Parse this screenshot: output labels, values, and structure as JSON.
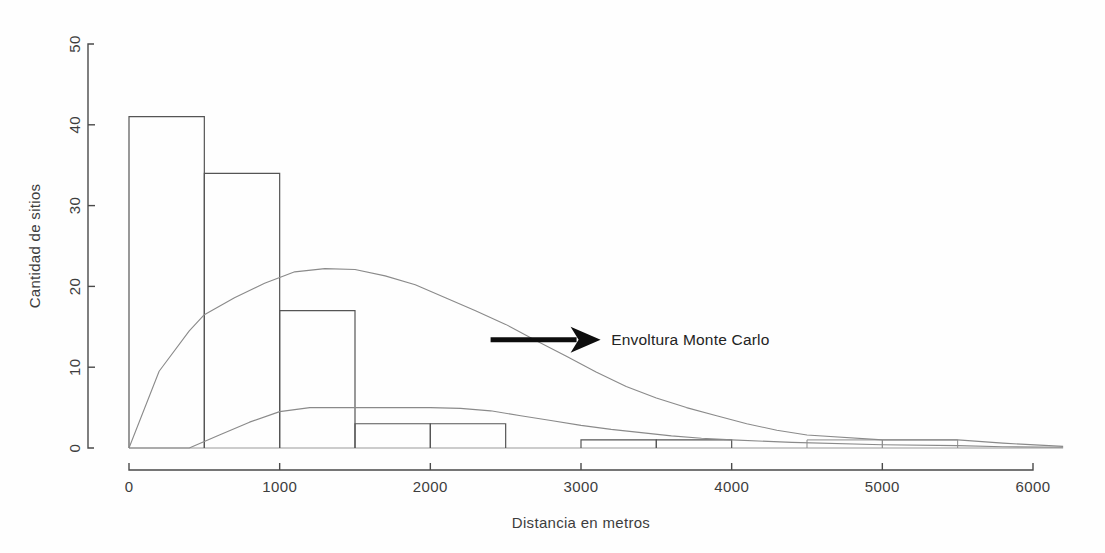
{
  "chart_data": {
    "type": "bar",
    "title": "",
    "subtitle": "",
    "xlabel": "Distancia en metros",
    "ylabel": "Cantidad de sitios",
    "xlim": [
      0,
      6200
    ],
    "ylim": [
      0,
      50
    ],
    "grid": false,
    "legend_position": "none",
    "bin_width": 500,
    "categories": [
      "0-500",
      "500-1000",
      "1000-1500",
      "1500-2000",
      "2000-2500",
      "2500-3000",
      "3000-3500",
      "3500-4000",
      "4000-4500",
      "4500-5000",
      "5000-5500",
      "5500-6000"
    ],
    "bin_starts": [
      0,
      500,
      1000,
      1500,
      2000,
      2500,
      3000,
      3500,
      4000,
      4500,
      5000,
      5500
    ],
    "values": [
      41,
      34,
      17,
      3,
      3,
      0,
      1,
      1,
      0,
      1,
      1,
      0
    ],
    "xticks": [
      0,
      1000,
      2000,
      3000,
      4000,
      5000,
      6000
    ],
    "xticklabels": [
      "0",
      "1000",
      "2000",
      "3000",
      "4000",
      "5000",
      "6000"
    ],
    "yticks": [
      0,
      10,
      20,
      30,
      40,
      50
    ],
    "yticklabels": [
      "0",
      "10",
      "20",
      "30",
      "40",
      "50"
    ],
    "series": [
      {
        "name": "Histograma de sitios",
        "type": "bar",
        "values": [
          41,
          34,
          17,
          3,
          3,
          0,
          1,
          1,
          0,
          1,
          1,
          0
        ]
      },
      {
        "name": "Envoltura Monte Carlo superior",
        "type": "line",
        "x": [
          0,
          200,
          400,
          500,
          700,
          900,
          1100,
          1300,
          1500,
          1700,
          1900,
          2100,
          2300,
          2500,
          2700,
          2900,
          3100,
          3300,
          3500,
          3700,
          3900,
          4100,
          4300,
          4500,
          5000,
          5500,
          5800,
          6200
        ],
        "y": [
          0,
          9.5,
          14.5,
          16.5,
          18.6,
          20.4,
          21.8,
          22.2,
          22.1,
          21.3,
          20.2,
          18.6,
          17.0,
          15.3,
          13.3,
          11.4,
          9.4,
          7.6,
          6.2,
          5.0,
          4.0,
          3.0,
          2.2,
          1.6,
          1.0,
          1.0,
          0.6,
          0.2
        ]
      },
      {
        "name": "Envoltura Monte Carlo inferior",
        "type": "line",
        "x": [
          0,
          400,
          600,
          800,
          1000,
          1200,
          1400,
          1600,
          1800,
          2000,
          2200,
          2400,
          2600,
          2800,
          3000,
          3200,
          3400,
          3600,
          3800,
          4000,
          4400,
          5000,
          5500,
          5800,
          6200
        ],
        "y": [
          0,
          0,
          1.6,
          3.2,
          4.5,
          5.0,
          5.0,
          5.0,
          5.0,
          5.0,
          4.9,
          4.6,
          4.0,
          3.4,
          2.8,
          2.3,
          1.9,
          1.5,
          1.2,
          1.0,
          0.7,
          0.4,
          0.3,
          0.15,
          0.1
        ]
      }
    ],
    "annotations": [
      {
        "text": "Envoltura Monte Carlo",
        "arrow": true,
        "arrow_from_x": 2400,
        "arrow_from_y": 13.4,
        "arrow_to_x": 3130,
        "arrow_to_y": 13.4,
        "text_x": 3200,
        "text_y": 13.4
      }
    ]
  },
  "annotation": {
    "label": "Envoltura Monte Carlo"
  },
  "axes": {
    "x_title": "Distancia en metros",
    "y_title": "Cantidad de sitios"
  },
  "colors": {
    "bar_stroke": "#555555",
    "bar_faint_stroke": "#8d8d8d",
    "envelope_stroke": "#8a8a8a",
    "axis": "#4a4a4a",
    "text": "#3d3d3d",
    "arrow": "#0d0d0d",
    "background": "#fefefe"
  }
}
